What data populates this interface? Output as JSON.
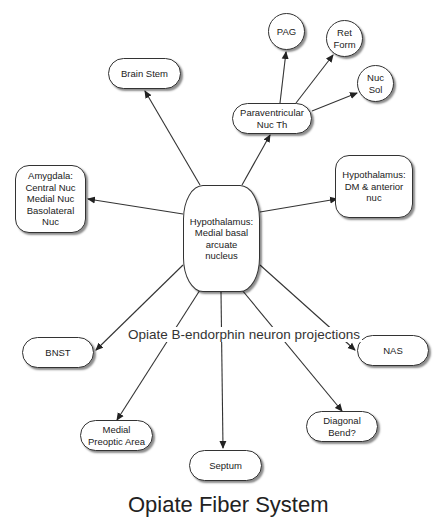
{
  "diagram": {
    "caption": "Opiate B-endorphin neuron projections",
    "footer_title": "Opiate Fiber System",
    "center": {
      "label": "Hypothalamus:\nMedial basal\narcuate\nnucleus"
    },
    "nodes": {
      "pag": "PAG",
      "ret_form": "Ret\nForm",
      "nuc_sol": "Nuc\nSol",
      "paraventricular": "Paraventricular\nNuc Th",
      "brain_stem": "Brain Stem",
      "amygdala": "Amygdala:\nCentral Nuc\nMedial Nuc\nBasolateral\nNuc",
      "hypothalamus_dm": "Hypothalamus:\nDM & anterior\nnuc",
      "bnst": "BNST",
      "nas": "NAS",
      "medial_preoptic": "Medial\nPreoptic Area",
      "septum": "Septum",
      "diagonal_band": "Diagonal\nBend?"
    },
    "edges": [
      {
        "from": "center",
        "to": "brain_stem"
      },
      {
        "from": "center",
        "to": "paraventricular"
      },
      {
        "from": "paraventricular",
        "to": "pag"
      },
      {
        "from": "paraventricular",
        "to": "ret_form"
      },
      {
        "from": "paraventricular",
        "to": "nuc_sol"
      },
      {
        "from": "center",
        "to": "amygdala"
      },
      {
        "from": "center",
        "to": "hypothalamus_dm"
      },
      {
        "from": "center",
        "to": "bnst"
      },
      {
        "from": "center",
        "to": "nas"
      },
      {
        "from": "center",
        "to": "medial_preoptic"
      },
      {
        "from": "center",
        "to": "septum"
      },
      {
        "from": "center",
        "to": "diagonal_band"
      }
    ],
    "colors": {
      "stroke": "#333333",
      "background": "#ffffff",
      "text": "#222222"
    }
  }
}
